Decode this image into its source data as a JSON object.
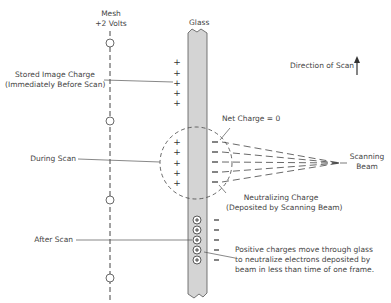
{
  "diagram": {
    "labels": {
      "mesh_line1": "Mesh",
      "mesh_line2": "+2 Volts",
      "glass": "Glass",
      "direction": "Direction of Scan",
      "stored_line1": "Stored Image Charge",
      "stored_line2": "(Immediately Before Scan)",
      "net_charge": "Net Charge = 0",
      "during_scan": "During Scan",
      "scanning_line1": "Scanning",
      "scanning_line2": "Beam",
      "neutralizing_line1": "Neutralizing Charge",
      "neutralizing_line2": "(Deposited by Scanning Beam)",
      "after_scan": "After Scan",
      "positive_line1": "Positive charges move through glass",
      "positive_line2": "to neutralize electrons deposited by",
      "positive_line3": "beam in less than time of one frame."
    },
    "symbols": {
      "plus": "+",
      "minus": "−",
      "circled_plus": "⊕"
    }
  }
}
